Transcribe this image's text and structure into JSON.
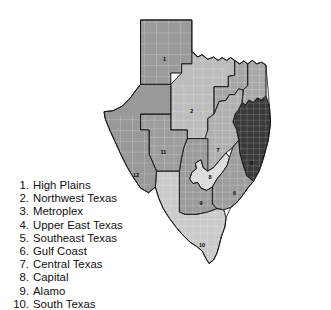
{
  "figure": {
    "kind": "choropleth-region-map"
  },
  "map": {
    "name": "texas-regions-map",
    "background_color": "#ffffff",
    "outline_color": "#111111",
    "county_line_color": "#f2f2f2",
    "regions": [
      {
        "id": "1",
        "number": "1",
        "name": "High Plains",
        "fill": "#9a9a9a",
        "label_x": 120,
        "label_y": 105
      },
      {
        "id": "2",
        "number": "2",
        "name": "Northwest Texas",
        "fill": "#bdbdbd",
        "label_x": 168,
        "label_y": 196
      },
      {
        "id": "3",
        "number": "3",
        "name": "Metroplex",
        "fill": "#a5a5a5",
        "label_x": 218,
        "label_y": 195
      },
      {
        "id": "4",
        "number": "4",
        "name": "Upper East Texas",
        "fill": "#a8a8a8",
        "label_x": 262,
        "label_y": 203
      },
      {
        "id": "5",
        "number": "5",
        "name": "Southeast Texas",
        "fill": "#3a3a3a",
        "label_x": 273,
        "label_y": 287
      },
      {
        "id": "6",
        "number": "6",
        "name": "Gulf Coast",
        "fill": "#9d9d9d",
        "label_x": 243,
        "label_y": 340
      },
      {
        "id": "7",
        "number": "7",
        "name": "Central Texas",
        "fill": "#b0b0b0",
        "label_x": 214,
        "label_y": 264
      },
      {
        "id": "8",
        "number": "8",
        "name": "Capital",
        "fill": "#dcdcdc",
        "label_x": 200,
        "label_y": 311
      },
      {
        "id": "9",
        "number": "9",
        "name": "Alamo",
        "fill": "#9b9b9b",
        "label_x": 184,
        "label_y": 357
      },
      {
        "id": "10",
        "number": "10",
        "name": "South Texas",
        "fill": "#cbcbcb",
        "label_x": 186,
        "label_y": 430
      },
      {
        "id": "11",
        "number": "11",
        "name": "",
        "fill": "#9e9e9e",
        "label_x": 118,
        "label_y": 267
      },
      {
        "id": "12",
        "number": "12",
        "name": "",
        "fill": "#999999",
        "label_x": 70,
        "label_y": 308
      }
    ]
  },
  "legend": {
    "title": "",
    "items": [
      {
        "number": "1.",
        "label": "High Plains"
      },
      {
        "number": "2.",
        "label": "Northwest Texas"
      },
      {
        "number": "3.",
        "label": "Metroplex"
      },
      {
        "number": "4.",
        "label": "Upper East Texas"
      },
      {
        "number": "5.",
        "label": "Southeast Texas"
      },
      {
        "number": "6.",
        "label": "Gulf Coast"
      },
      {
        "number": "7.",
        "label": "Central Texas"
      },
      {
        "number": "8.",
        "label": "Capital"
      },
      {
        "number": "9.",
        "label": "Alamo"
      },
      {
        "number": "10.",
        "label": "South Texas"
      }
    ]
  }
}
